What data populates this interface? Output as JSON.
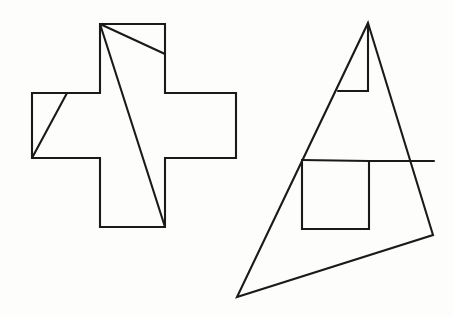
{
  "figure": {
    "background_color": "#fdfdfc",
    "stroke_color": "#1a1a1a",
    "stroke_width": 2.1,
    "canvas": {
      "width": 453,
      "height": 317
    },
    "shapes": [
      {
        "id": "greek-cross",
        "name": "greek-cross-outline",
        "kind": "polygon",
        "closed": true,
        "points": "100,24 165,24 165,93 236,93 236,158 165,158 165,227 100,227 100,158 32,158 32,93 100,93",
        "description": "Plus / Greek cross outline on the left"
      },
      {
        "id": "cross-cut-top",
        "name": "cross-cut-line-top",
        "kind": "line",
        "closed": false,
        "points": "100,24 165,54",
        "description": "Short diagonal cut from cross top-left corner to right side of upper arm"
      },
      {
        "id": "cross-cut-long",
        "name": "cross-cut-line-long",
        "kind": "line",
        "closed": false,
        "points": "100,24 165,227",
        "description": "Long diagonal cut from cross top-left corner to bottom-right of lower arm"
      },
      {
        "id": "cross-cut-left",
        "name": "cross-cut-line-left",
        "kind": "line",
        "closed": false,
        "points": "32,158 67,93",
        "description": "Diagonal cut across the left arm of the cross"
      },
      {
        "id": "triangle-outline",
        "name": "triangle-outline",
        "kind": "polygon",
        "closed": true,
        "points": "368,23 433,235 237,297",
        "description": "Large scalene triangle on the right"
      },
      {
        "id": "triangle-inner-notch-top",
        "name": "triangle-inner-notch-top",
        "kind": "polyline",
        "closed": false,
        "points": "338,91 368,91 368,23",
        "description": "Small step notch near the triangle apex"
      },
      {
        "id": "triangle-inner-step",
        "name": "triangle-inner-step",
        "kind": "polyline",
        "closed": false,
        "points": "302,160 302,229 369,229 369,161 434,161",
        "description": "Large step / stair outline inside the triangle body"
      },
      {
        "id": "triangle-inner-step-top",
        "name": "triangle-inner-step-top-edge",
        "kind": "polyline",
        "closed": false,
        "points": "302,160 369,161",
        "description": "Top edge of the interior step figure"
      }
    ]
  }
}
